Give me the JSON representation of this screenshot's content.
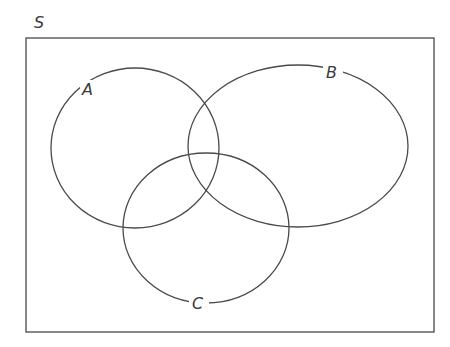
{
  "diagram": {
    "type": "venn",
    "universe": {
      "label": "S",
      "rect": {
        "x": 26,
        "y": 38,
        "width": 408,
        "height": 294
      }
    },
    "sets": [
      {
        "label": "A",
        "cx": 135,
        "cy": 148,
        "rx": 84,
        "ry": 80,
        "label_x": 88,
        "label_y": 95
      },
      {
        "label": "B",
        "cx": 298,
        "cy": 146,
        "rx": 110,
        "ry": 81,
        "label_x": 333,
        "label_y": 78
      },
      {
        "label": "C",
        "cx": 206,
        "cy": 228,
        "rx": 83,
        "ry": 75,
        "label_x": 199,
        "label_y": 309
      }
    ],
    "colors": {
      "stroke": "#4a4a4a",
      "background": "#ffffff",
      "text": "#3a3a3a"
    }
  }
}
